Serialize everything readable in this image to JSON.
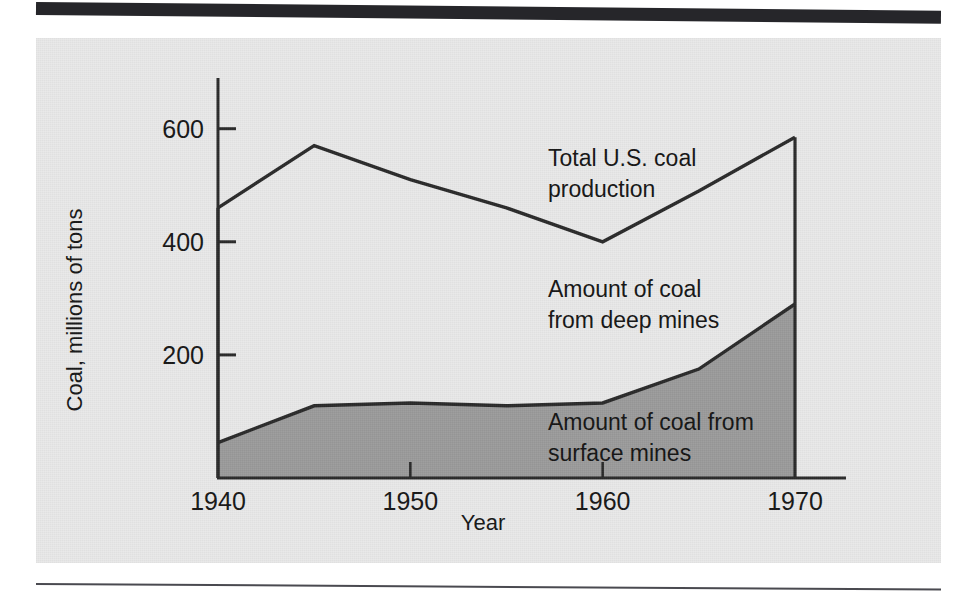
{
  "figure": {
    "background_color": "#e9e9e9",
    "page_background": "#ffffff",
    "rule_color": "#26262a"
  },
  "chart_data": {
    "type": "area",
    "title": "",
    "subtitle": "",
    "xlabel": "Year",
    "ylabel": "Coal, millions of tons",
    "x": [
      1940,
      1945,
      1950,
      1955,
      1960,
      1965,
      1970
    ],
    "xlim": [
      1938,
      1971
    ],
    "ylim": [
      0,
      680
    ],
    "xticks": [
      1940,
      1950,
      1960,
      1970
    ],
    "xticklabels": [
      "1940",
      "1950",
      "1960",
      "1970"
    ],
    "yticks": [
      200,
      400,
      600
    ],
    "yticklabels": [
      "200",
      "400",
      "600"
    ],
    "grid": false,
    "legend_position": "inline-annotations",
    "series": [
      {
        "name": "Total U.S. coal production",
        "values": [
          460,
          570,
          510,
          460,
          400,
          490,
          585
        ],
        "style": "line",
        "color": "#2a2a2a",
        "fill": "none",
        "annotation": "Total U.S. coal production"
      },
      {
        "name": "Amount of coal from surface mines",
        "values": [
          45,
          110,
          115,
          110,
          115,
          175,
          290
        ],
        "style": "area",
        "color": "#2a2a2a",
        "fill": "#9b9b9b",
        "annotation": "Amount of coal from surface mines"
      }
    ],
    "region_annotations": [
      {
        "name": "deep-mines-region",
        "text": "Amount of coal from deep mines",
        "description": "Unshaded band between the surface-mine curve and the total production curve"
      }
    ]
  },
  "annotations": {
    "total_production": {
      "line1": "Total U.S. coal",
      "line2": "production"
    },
    "deep_mines": {
      "line1": "Amount of coal",
      "line2": "from deep mines"
    },
    "surface_mines": {
      "line1": "Amount of coal from",
      "line2": "surface mines"
    }
  },
  "axes": {
    "y_title": "Coal, millions of tons",
    "x_title": "Year",
    "y_tick_600": "600",
    "y_tick_400": "400",
    "y_tick_200": "200",
    "x_tick_1940": "1940",
    "x_tick_1950": "1950",
    "x_tick_1960": "1960",
    "x_tick_1970": "1970"
  }
}
